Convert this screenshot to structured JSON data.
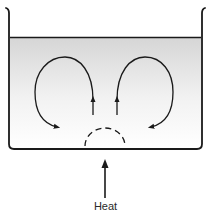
{
  "diagram": {
    "labels": {
      "heat": "Heat"
    },
    "components": [
      {
        "id": "container",
        "type": "open-topped beaker/tank",
        "description": "container with flared rim"
      },
      {
        "id": "liquid",
        "type": "liquid fill",
        "description": "shaded liquid, gradient from gray at surface to white at bottom"
      },
      {
        "id": "left-convection-loop",
        "type": "curved arrow loop",
        "direction": "rises in center, flows outward left, sinks, returns to center bottom"
      },
      {
        "id": "right-convection-loop",
        "type": "curved arrow loop",
        "direction": "rises in center, flows outward right, sinks, returns to center bottom"
      },
      {
        "id": "heated-region",
        "type": "dashed semicircle",
        "description": "warm region above heat source"
      },
      {
        "id": "heat-arrow",
        "type": "straight arrow",
        "direction": "up",
        "label": "Heat"
      }
    ],
    "colors": {
      "stroke": "#1a1a1a",
      "liquid_top": "#d6d6d6",
      "liquid_bottom": "#ffffff",
      "background": "#ffffff",
      "label": "#2a2a2a"
    }
  }
}
